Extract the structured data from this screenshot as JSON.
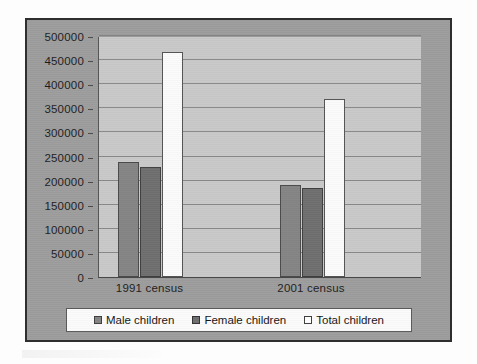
{
  "chart_data": {
    "type": "bar",
    "title": "",
    "subtitle": "",
    "xlabel": "",
    "ylabel": "",
    "categories": [
      "1991 census",
      "2001 census"
    ],
    "series": [
      {
        "name": "Male children",
        "values": [
          238000,
          190000
        ],
        "color": "#858585"
      },
      {
        "name": "Female children",
        "values": [
          229000,
          184000
        ],
        "color": "#6f6f6f"
      },
      {
        "name": "Total children",
        "values": [
          467000,
          369000
        ],
        "color": "#ffffff"
      }
    ],
    "ylim": [
      0,
      500000
    ],
    "ytick_step": 50000,
    "yticks": [
      0,
      50000,
      100000,
      150000,
      200000,
      250000,
      300000,
      350000,
      400000,
      450000,
      500000
    ],
    "ytick_labels": [
      "0",
      "50000",
      "100000",
      "150000",
      "200000",
      "250000",
      "300000",
      "350000",
      "400000",
      "450000",
      "500000"
    ],
    "grid": true,
    "grid_axis": "y",
    "legend_position": "bottom",
    "legend_entries": [
      "Male children",
      "Female children",
      "Total children"
    ],
    "plot_background": "#c9c9c9",
    "frame_background": "#9d9d9d"
  }
}
